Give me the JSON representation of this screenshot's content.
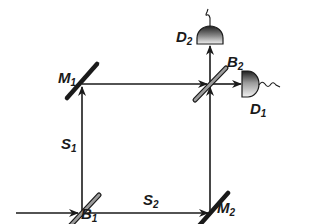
{
  "diagram": {
    "type": "Mach-Zehnder interferometer",
    "colors": {
      "beam": "#1a1a1a",
      "mirror": "#1a1a1a",
      "splitter_fill": "#bbbbbb",
      "detector_dark": "#2a2a2a",
      "detector_light": "#f0f0f0"
    },
    "labels": {
      "M1": {
        "base": "M",
        "sub": "1"
      },
      "M2": {
        "base": "M",
        "sub": "2"
      },
      "B1": {
        "base": "B",
        "sub": "1"
      },
      "B2": {
        "base": "B",
        "sub": "2"
      },
      "D1": {
        "base": "D",
        "sub": "1"
      },
      "D2": {
        "base": "D",
        "sub": "2"
      },
      "S1": {
        "base": "S",
        "sub": "1"
      },
      "S2": {
        "base": "S",
        "sub": "2"
      }
    },
    "components": [
      {
        "id": "B1",
        "kind": "beam-splitter",
        "role": "input beam splitter"
      },
      {
        "id": "B2",
        "kind": "beam-splitter",
        "role": "output beam splitter"
      },
      {
        "id": "M1",
        "kind": "mirror",
        "role": "upper-left mirror"
      },
      {
        "id": "M2",
        "kind": "mirror",
        "role": "lower-right mirror"
      },
      {
        "id": "D1",
        "kind": "detector",
        "role": "right detector"
      },
      {
        "id": "D2",
        "kind": "detector",
        "role": "top detector"
      }
    ],
    "paths": [
      {
        "id": "S1",
        "from": "B1",
        "to": "M1"
      },
      {
        "id": "S2",
        "from": "B1",
        "to": "M2"
      }
    ]
  }
}
